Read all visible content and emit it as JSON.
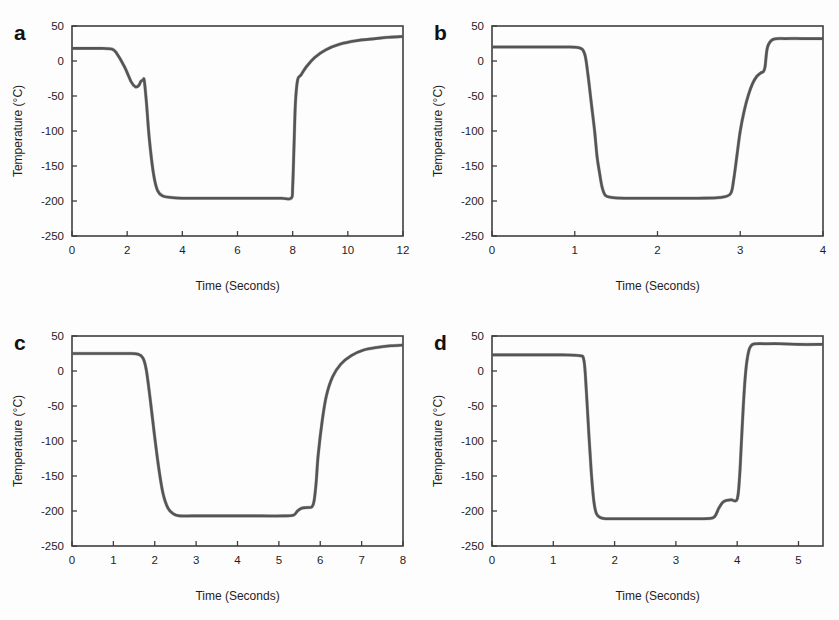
{
  "figure": {
    "background": "#fdfdfd",
    "trace_color": "#555555",
    "axis_color": "#3f3f3f",
    "panel_count": 4
  },
  "panels": [
    {
      "letter": "a",
      "id": "panel-a"
    },
    {
      "letter": "b",
      "id": "panel-b"
    },
    {
      "letter": "c",
      "id": "panel-c"
    },
    {
      "letter": "d",
      "id": "panel-d"
    }
  ],
  "chart_data": [
    {
      "type": "line",
      "title": "a",
      "xlabel": "Time (Seconds)",
      "ylabel": "Temperature (°C)",
      "xlim": [
        0,
        12
      ],
      "ylim": [
        -250,
        50
      ],
      "xticks": [
        0,
        2,
        4,
        6,
        8,
        10,
        12
      ],
      "xtick_labels": [
        "0",
        "2",
        "4",
        "6",
        "8",
        "10",
        "12"
      ],
      "yticks": [
        50,
        0,
        -50,
        -100,
        -150,
        -200,
        -250
      ],
      "ytick_labels": [
        "50",
        "0",
        "-50",
        "-100",
        "-150",
        "-200",
        "-250"
      ],
      "grid": false,
      "legend": null,
      "series": [
        {
          "name": "Temperature",
          "x": [
            0.0,
            0.3,
            0.7,
            1.1,
            1.45,
            1.6,
            1.9,
            2.15,
            2.3,
            2.42,
            2.5,
            2.58,
            2.62,
            2.7,
            2.8,
            2.95,
            3.1,
            3.3,
            3.6,
            4.0,
            4.6,
            5.4,
            6.2,
            7.0,
            7.6,
            7.95,
            8.0,
            8.05,
            8.1,
            8.18,
            8.3,
            8.5,
            8.8,
            9.2,
            9.7,
            10.3,
            11.0,
            11.5,
            12.0
          ],
          "y": [
            18,
            18,
            18,
            18,
            17,
            12,
            -8,
            -30,
            -37,
            -35,
            -29,
            -27,
            -28,
            -60,
            -110,
            -160,
            -185,
            -193,
            -195,
            -196,
            -196,
            -196,
            -196,
            -196,
            -196,
            -196,
            -180,
            -120,
            -60,
            -27,
            -20,
            -8,
            5,
            16,
            24,
            29,
            32,
            34,
            35
          ]
        }
      ]
    },
    {
      "type": "line",
      "title": "b",
      "xlabel": "Time (Seconds)",
      "ylabel": "Temperature (°C)",
      "xlim": [
        0,
        4
      ],
      "ylim": [
        -250,
        50
      ],
      "xticks": [
        0,
        1,
        2,
        3,
        4
      ],
      "xtick_labels": [
        "0",
        "1",
        "2",
        "3",
        "4"
      ],
      "yticks": [
        50,
        0,
        -50,
        -100,
        -150,
        -200,
        -250
      ],
      "ytick_labels": [
        "50",
        "0",
        "-50",
        "-100",
        "-150",
        "-200",
        "-250"
      ],
      "grid": false,
      "legend": null,
      "series": [
        {
          "name": "Temperature",
          "x": [
            0.0,
            0.25,
            0.55,
            0.85,
            1.05,
            1.12,
            1.16,
            1.2,
            1.24,
            1.27,
            1.3,
            1.33,
            1.37,
            1.45,
            1.6,
            1.9,
            2.2,
            2.5,
            2.75,
            2.88,
            2.92,
            2.96,
            3.0,
            3.05,
            3.1,
            3.15,
            3.2,
            3.25,
            3.28,
            3.3,
            3.33,
            3.4,
            3.55,
            3.75,
            4.0
          ],
          "y": [
            20,
            20,
            20,
            20,
            19,
            10,
            -20,
            -60,
            -100,
            -137,
            -160,
            -180,
            -192,
            -195,
            -196,
            -196,
            -196,
            -196,
            -195,
            -190,
            -170,
            -135,
            -100,
            -70,
            -48,
            -32,
            -22,
            -17,
            -15,
            -8,
            20,
            31,
            32,
            32,
            32
          ]
        }
      ]
    },
    {
      "type": "line",
      "title": "c",
      "xlabel": "Time (Seconds)",
      "ylabel": "Temperature (°C)",
      "xlim": [
        0,
        8
      ],
      "ylim": [
        -250,
        50
      ],
      "xticks": [
        0,
        1,
        2,
        3,
        4,
        5,
        6,
        7,
        8
      ],
      "xtick_labels": [
        "0",
        "1",
        "2",
        "3",
        "4",
        "5",
        "6",
        "7",
        "8"
      ],
      "yticks": [
        50,
        0,
        -50,
        -100,
        -150,
        -200,
        -250
      ],
      "ytick_labels": [
        "50",
        "0",
        "-50",
        "-100",
        "-150",
        "-200",
        "-250"
      ],
      "grid": false,
      "legend": null,
      "series": [
        {
          "name": "Temperature",
          "x": [
            0.0,
            0.4,
            0.9,
            1.35,
            1.6,
            1.72,
            1.8,
            1.9,
            2.0,
            2.1,
            2.2,
            2.32,
            2.45,
            2.6,
            2.9,
            3.4,
            4.0,
            4.6,
            5.1,
            5.35,
            5.45,
            5.55,
            5.7,
            5.8,
            5.85,
            5.9,
            5.95,
            6.05,
            6.15,
            6.3,
            6.5,
            6.75,
            7.05,
            7.4,
            7.7,
            8.0
          ],
          "y": [
            25,
            25,
            25,
            25,
            24,
            18,
            0,
            -45,
            -95,
            -140,
            -175,
            -196,
            -204,
            -207,
            -207,
            -207,
            -207,
            -207,
            -207,
            -206,
            -200,
            -196,
            -195,
            -194,
            -186,
            -160,
            -120,
            -70,
            -35,
            -8,
            10,
            22,
            30,
            34,
            36,
            37
          ]
        }
      ]
    },
    {
      "type": "line",
      "title": "d",
      "xlabel": "Time (Seconds)",
      "ylabel": "Temperature (°C)",
      "xlim": [
        0,
        5.4
      ],
      "ylim": [
        -250,
        50
      ],
      "xticks": [
        0,
        1,
        2,
        3,
        4,
        5
      ],
      "xtick_labels": [
        "0",
        "1",
        "2",
        "3",
        "4",
        "5"
      ],
      "yticks": [
        50,
        0,
        -50,
        -100,
        -150,
        -200,
        -250
      ],
      "ytick_labels": [
        "50",
        "0",
        "-50",
        "-100",
        "-150",
        "-200",
        "-250"
      ],
      "grid": false,
      "legend": null,
      "series": [
        {
          "name": "Temperature",
          "x": [
            0.0,
            0.35,
            0.75,
            1.15,
            1.42,
            1.5,
            1.54,
            1.58,
            1.62,
            1.66,
            1.7,
            1.76,
            1.85,
            2.0,
            2.3,
            2.7,
            3.1,
            3.45,
            3.62,
            3.7,
            3.76,
            3.82,
            3.9,
            4.0,
            4.04,
            4.07,
            4.1,
            4.13,
            4.16,
            4.2,
            4.25,
            4.32,
            4.45,
            4.7,
            5.0,
            5.4
          ],
          "y": [
            23,
            23,
            23,
            23,
            22,
            15,
            -30,
            -90,
            -145,
            -185,
            -203,
            -209,
            -211,
            -211,
            -211,
            -211,
            -211,
            -211,
            -209,
            -196,
            -188,
            -185,
            -184,
            -183,
            -150,
            -100,
            -50,
            -10,
            15,
            32,
            38,
            39,
            39,
            39,
            38,
            38
          ]
        }
      ]
    }
  ]
}
